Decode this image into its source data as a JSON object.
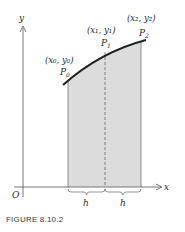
{
  "figure": {
    "caption": "FIGURE 8.10.2",
    "axes": {
      "x_label": "x",
      "y_label": "y",
      "origin_label": "O"
    },
    "points": [
      {
        "name": "P0",
        "label": "P",
        "sub": "0",
        "coord_label": "(x₀, y₀)"
      },
      {
        "name": "P1",
        "label": "P",
        "sub": "1",
        "coord_label": "(x₁, y₁)"
      },
      {
        "name": "P2",
        "label": "P",
        "sub": "2",
        "coord_label": "(x₂, y₂)"
      }
    ],
    "intervals": [
      {
        "label": "h"
      },
      {
        "label": "h"
      }
    ],
    "colors": {
      "curve": "#222222",
      "shade": "#dcdcdc",
      "axis": "#555555",
      "dashed": "#666666"
    }
  }
}
